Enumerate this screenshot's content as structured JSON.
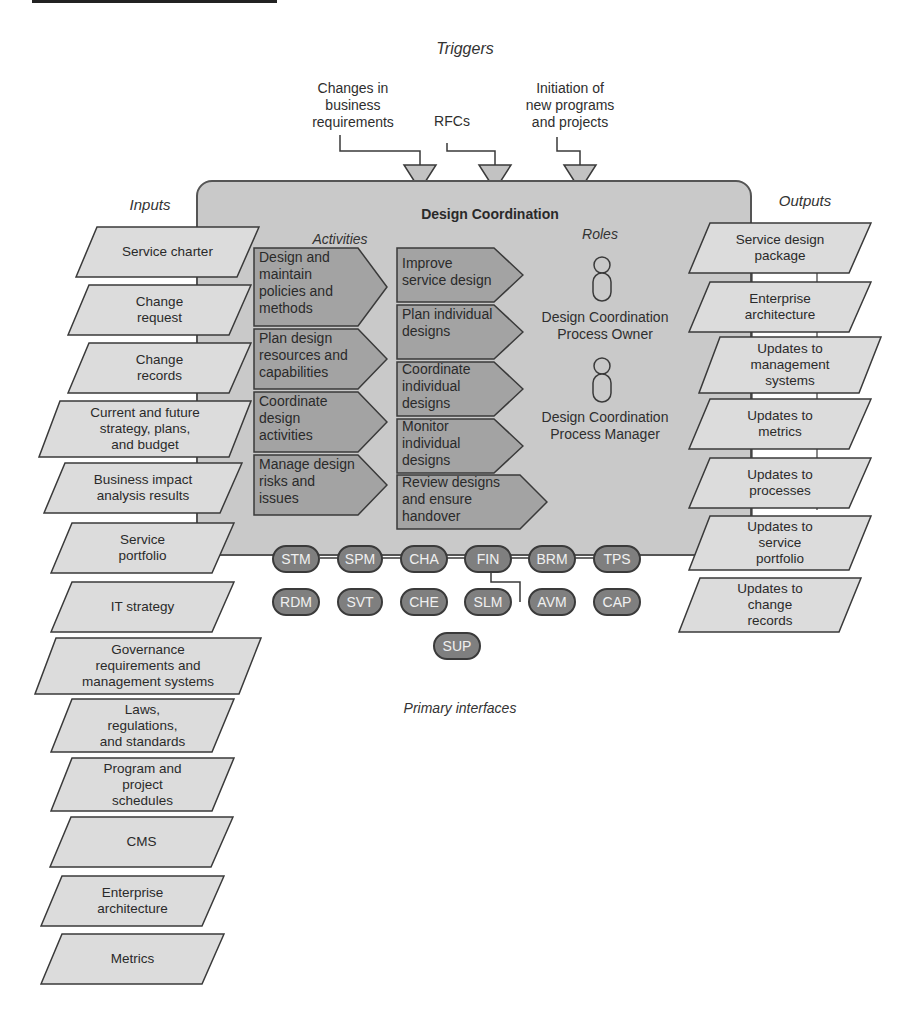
{
  "diagram": {
    "title": "Design Coordination",
    "triggers": {
      "heading": "Triggers",
      "items": [
        {
          "label": "Changes in\nbusiness\nrequirements"
        },
        {
          "label": "RFCs"
        },
        {
          "label": "Initiation of\nnew programs\nand projects"
        }
      ]
    },
    "inputs": {
      "heading": "Inputs",
      "items": [
        {
          "label": "Service charter"
        },
        {
          "label": "Change\nrequest"
        },
        {
          "label": "Change\nrecords"
        },
        {
          "label": "Current and future\nstrategy, plans,\nand budget"
        },
        {
          "label": "Business impact\nanalysis results"
        },
        {
          "label": "Service\nportfolio"
        },
        {
          "label": "IT strategy"
        },
        {
          "label": "Governance\nrequirements and\nmanagement systems"
        },
        {
          "label": "Laws,\nregulations,\nand standards"
        },
        {
          "label": "Program and\nproject\nschedules"
        },
        {
          "label": "CMS"
        },
        {
          "label": "Enterprise\narchitecture"
        },
        {
          "label": "Metrics"
        }
      ]
    },
    "activities": {
      "heading": "Activities",
      "left": [
        {
          "label": "Design and\nmaintain\npolicies and\nmethods"
        },
        {
          "label": "Plan design\nresources and\ncapabilities"
        },
        {
          "label": "Coordinate\ndesign\nactivities"
        },
        {
          "label": "Manage design\nrisks and\nissues"
        }
      ],
      "right": [
        {
          "label": "Improve\nservice design"
        },
        {
          "label": "Plan individual\ndesigns"
        },
        {
          "label": "Coordinate\nindividual\ndesigns"
        },
        {
          "label": "Monitor\nindividual\ndesigns"
        },
        {
          "label": "Review designs\nand ensure\nhandover"
        }
      ]
    },
    "roles": {
      "heading": "Roles",
      "items": [
        {
          "label": "Design Coordination\nProcess Owner"
        },
        {
          "label": "Design Coordination\nProcess Manager"
        }
      ]
    },
    "outputs": {
      "heading": "Outputs",
      "items": [
        {
          "label": "Service design\npackage"
        },
        {
          "label": "Enterprise\narchitecture"
        },
        {
          "label": "Updates to\nmanagement\nsystems"
        },
        {
          "label": "Updates to\nmetrics"
        },
        {
          "label": "Updates to\nprocesses"
        },
        {
          "label": "Updates to\nservice\nportfolio"
        },
        {
          "label": "Updates to\nchange\nrecords"
        }
      ]
    },
    "interfaces": {
      "heading": "Primary interfaces",
      "row1": [
        "STM",
        "SPM",
        "CHA",
        "FIN",
        "BRM",
        "TPS"
      ],
      "row2": [
        "RDM",
        "SVT",
        "CHE",
        "SLM",
        "AVM",
        "CAP"
      ],
      "row3": [
        "SUP"
      ]
    },
    "colors": {
      "box_fill": "#c9c9c9",
      "io_fill": "#dcdcdc",
      "activity_fill": "#a3a3a3",
      "pill_fill": "#7f7f7f",
      "stroke": "#3a3a3a"
    }
  }
}
